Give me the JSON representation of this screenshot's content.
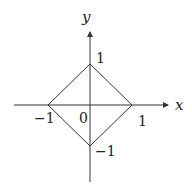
{
  "diagram": {
    "axes": {
      "x_label": "x",
      "y_label": "y"
    },
    "ticks": {
      "x_pos": "1",
      "x_neg": "−1",
      "y_pos": "1",
      "y_neg": "−1",
      "origin": "0"
    },
    "shape": "square |x|+|y|=1",
    "colors": {
      "line": "#333333",
      "background": "#ffffff"
    }
  }
}
